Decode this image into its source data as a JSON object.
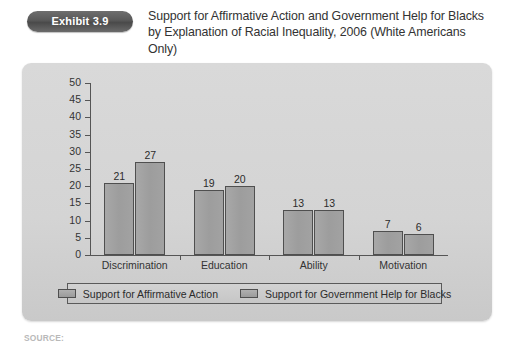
{
  "header": {
    "badge_label": "Exhibit 3.9",
    "title": "Support for Affirmative Action and Government Help for Blacks by Explanation of Racial Inequality, 2006 (White Americans Only)"
  },
  "source_note": "SOURCE:",
  "colors": {
    "badge_background": "#585858",
    "panel_background": "#d4d4d4",
    "bar_fill": "#9d9d9d",
    "bar_border": "#4f4f4f",
    "axis": "#555555",
    "text": "#2b2b2b"
  },
  "chart_data": {
    "type": "bar",
    "title": "Support for Affirmative Action and Government Help for Blacks by Explanation of Racial Inequality, 2006 (White Americans Only)",
    "xlabel": "",
    "ylabel": "",
    "ylim": [
      0,
      50
    ],
    "yticks": [
      0,
      5,
      10,
      15,
      20,
      25,
      30,
      35,
      40,
      45,
      50
    ],
    "grid": false,
    "legend_position": "bottom",
    "categories": [
      "Discrimination",
      "Education",
      "Ability",
      "Motivation"
    ],
    "series": [
      {
        "name": "Support for Affirmative Action",
        "values": [
          21,
          19,
          13,
          7
        ]
      },
      {
        "name": "Support for Government Help for Blacks",
        "values": [
          27,
          20,
          13,
          6
        ]
      }
    ]
  }
}
